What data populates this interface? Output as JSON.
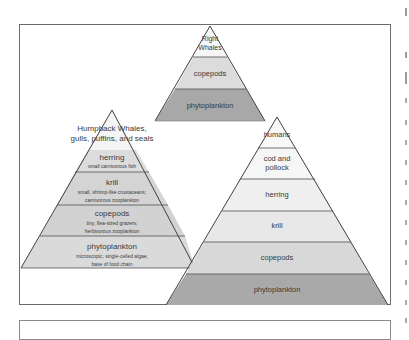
{
  "colors": {
    "frame_border": "#6a6a6a",
    "outline": "#404040",
    "lightest": "#f2f2f2",
    "light": "#dedede",
    "medium": "#cfcfcf",
    "dark": "#a9a9a9",
    "text": "#3a3a3a"
  },
  "pyramids": {
    "right_whales": {
      "levels": [
        {
          "label": "Right\nWhales",
          "line1": "Right",
          "line2": "Whales"
        },
        {
          "label": "copepods"
        },
        {
          "label": "phytoplankton"
        }
      ]
    },
    "humpback": {
      "title_line1": "Humpback Whales,",
      "title_line2": "gulls, puffins, and seals",
      "levels": [
        {
          "label": "herring",
          "sub1": "small carnivorous fish"
        },
        {
          "label": "krill",
          "sub1": "small, shrimp-like crustaceans;",
          "sub2": "carnivorous zooplankton"
        },
        {
          "label": "copepods",
          "sub1": "tiny, flea-sized grazers;",
          "sub2": "herbivorous zooplankton"
        },
        {
          "label": "phytoplankton",
          "sub1": "microscopic, single-celled algae;",
          "sub2": "base of food chain"
        }
      ]
    },
    "human_chain": {
      "levels": [
        {
          "label": "humans"
        },
        {
          "label": "cod and",
          "label2": "pollock"
        },
        {
          "label": "herring"
        },
        {
          "label": "krill"
        },
        {
          "label": "copepods"
        },
        {
          "label": "phytoplankton"
        }
      ]
    }
  }
}
